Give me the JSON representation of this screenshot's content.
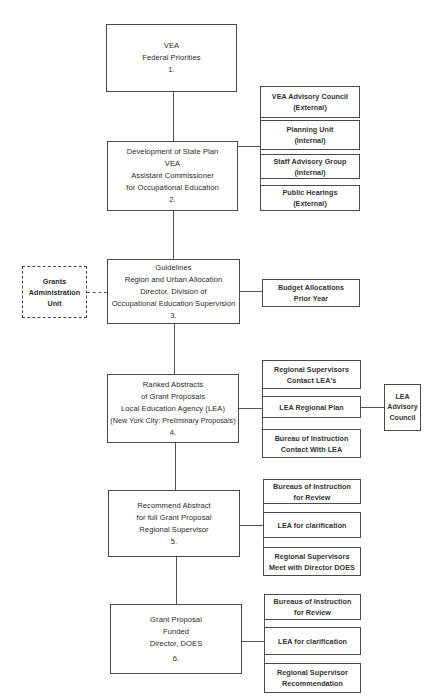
{
  "diagram": {
    "main_steps": [
      {
        "lines": [
          "VEA",
          "Federal Priorities",
          "1."
        ]
      },
      {
        "lines": [
          "Development of State Plan",
          "VEA",
          "Assistant Commissioner",
          "for Occupational Education",
          "2."
        ]
      },
      {
        "lines": [
          "Guidelines",
          "Region and Urban Allocation",
          "Director, Division of",
          "Occupational Education Supervision",
          "3."
        ]
      },
      {
        "lines": [
          "Ranked Abstracts",
          "of Grant Proposals",
          "Local Education Agency (LEA)",
          "(New York City: Preliminary Proposals)",
          "4."
        ]
      },
      {
        "lines": [
          "Recommend Abstract",
          "for full Grant Proposal",
          "Regional Supervisor",
          "5."
        ]
      },
      {
        "lines": [
          "Grant Proposal",
          "Funded",
          "Director, DOES",
          "6."
        ]
      }
    ],
    "step2_inputs": [
      {
        "lines": [
          "VEA Advisory Council",
          "(External)"
        ]
      },
      {
        "lines": [
          "Planning Unit",
          "(Internal)"
        ]
      },
      {
        "lines": [
          "Staff Advisory Group",
          "(Internal)"
        ]
      },
      {
        "lines": [
          "Public Hearings",
          "(External)"
        ]
      }
    ],
    "step3_left": {
      "lines": [
        "Grants",
        "Administration",
        "Unit"
      ],
      "style": "dashed"
    },
    "step3_inputs": [
      {
        "lines": [
          "Budget Allocations",
          "Prior Year"
        ]
      }
    ],
    "step4_inputs": [
      {
        "lines": [
          "Regional Supervisors",
          "Contact LEA's"
        ]
      },
      {
        "lines": [
          "LEA Regional Plan"
        ]
      },
      {
        "lines": [
          "Bureau of Instruction",
          "Contact With LEA"
        ]
      }
    ],
    "step4_far_right": {
      "lines": [
        "LEA",
        "Advisory",
        "Council"
      ]
    },
    "step5_inputs": [
      {
        "lines": [
          "Bureaus of Instruction",
          "for Review"
        ]
      },
      {
        "lines": [
          "LEA for clarification"
        ]
      },
      {
        "lines": [
          "Regional Supervisors",
          "Meet with Director DOES"
        ]
      }
    ],
    "step6_inputs": [
      {
        "lines": [
          "Bureaus of Instruction",
          "for Review"
        ]
      },
      {
        "lines": [
          "LEA for clarification"
        ]
      },
      {
        "lines": [
          "Regional Supervisor",
          "Recommendation"
        ]
      }
    ]
  }
}
